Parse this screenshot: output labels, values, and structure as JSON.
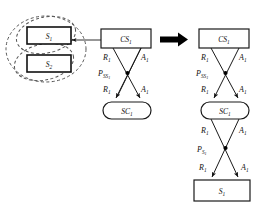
{
  "figure": {
    "background_color": "#ffffff",
    "ink_color": "#111111",
    "dashed_color": "#555555"
  },
  "left_panel": {
    "group_label": "abstract service group",
    "nodes": [
      {
        "id": "s1",
        "label": "S",
        "sub": "1",
        "shape": "rect"
      },
      {
        "id": "s2",
        "label": "S",
        "sub": "2",
        "shape": "rect"
      }
    ],
    "ellipses": [
      {
        "name": "outer-group-ellipse",
        "style": "dashed"
      },
      {
        "name": "inner-ellipse-s1",
        "style": "dashed"
      },
      {
        "name": "inner-ellipse-s2",
        "style": "dashed"
      }
    ],
    "incoming_arrow": {
      "name": "selection-arrow",
      "direction": "left"
    }
  },
  "middle_panel": {
    "nodes": [
      {
        "id": "cs1",
        "label": "CS",
        "sub": "1",
        "shape": "rect"
      },
      {
        "id": "sc1",
        "label": "SC",
        "sub": "1",
        "shape": "rounded"
      }
    ],
    "edge_labels": {
      "r_upper": {
        "base": "R",
        "sub": "1"
      },
      "a_upper": {
        "base": "A",
        "sub": "1"
      },
      "p_junction": {
        "base": "P",
        "sub": "SS",
        "sub2": "1"
      },
      "r_lower": {
        "base": "R",
        "sub": "1"
      },
      "a_lower": {
        "base": "A",
        "sub": "1"
      }
    }
  },
  "transform_arrow": {
    "name": "transform-arrow",
    "direction": "right",
    "color": "#000000"
  },
  "right_panel": {
    "nodes": [
      {
        "id": "cs1",
        "label": "CS",
        "sub": "1",
        "shape": "rect"
      },
      {
        "id": "sc1",
        "label": "SC",
        "sub": "1",
        "shape": "rounded"
      },
      {
        "id": "s1",
        "label": "S",
        "sub": "1",
        "shape": "rect"
      }
    ],
    "edge_labels": {
      "r_top": {
        "base": "R",
        "sub": "1"
      },
      "a_top": {
        "base": "A",
        "sub": "1"
      },
      "p_top_junction": {
        "base": "P",
        "sub": "SS",
        "sub2": "1"
      },
      "r_mid": {
        "base": "R",
        "sub": "1"
      },
      "a_mid": {
        "base": "A",
        "sub": "1"
      },
      "r_lower": {
        "base": "R",
        "sub": "1"
      },
      "a_lower": {
        "base": "A",
        "sub": "1"
      },
      "p_bottom_junction": {
        "base": "P",
        "sub": "S",
        "sub2": "1"
      },
      "r_bottom": {
        "base": "R",
        "sub": "1"
      },
      "a_bottom": {
        "base": "A",
        "sub": "1"
      }
    }
  }
}
